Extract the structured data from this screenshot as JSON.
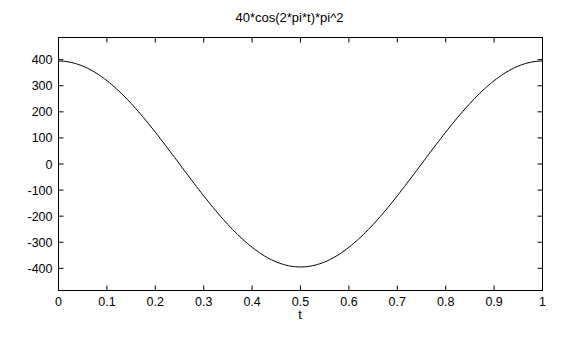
{
  "chart_data": {
    "type": "line",
    "title": "40*cos(2*pi*t)*pi^2",
    "xlabel": "t",
    "ylabel": "",
    "xlim": [
      0,
      1
    ],
    "ylim": [
      -485,
      485
    ],
    "xticks": [
      0,
      0.1,
      0.2,
      0.3,
      0.4,
      0.5,
      0.6,
      0.7,
      0.8,
      0.9,
      1
    ],
    "xtick_labels": [
      "0",
      "0.1",
      "0.2",
      "0.3",
      "0.4",
      "0.5",
      "0.6",
      "0.7",
      "0.8",
      "0.9",
      "1"
    ],
    "yticks": [
      400,
      300,
      200,
      100,
      0,
      -100,
      -200,
      -300,
      -400
    ],
    "ytick_labels": [
      "400",
      "300",
      "200",
      "100",
      "0",
      "-100",
      "-200",
      "-300",
      "-400"
    ],
    "grid": false,
    "legend": null,
    "series": [
      {
        "name": "40*cos(2*pi*t)*pi^2",
        "color": "#000000",
        "x": [
          0,
          0.05,
          0.1,
          0.15,
          0.2,
          0.25,
          0.3,
          0.35,
          0.4,
          0.45,
          0.5,
          0.55,
          0.6,
          0.65,
          0.7,
          0.75,
          0.8,
          0.85,
          0.9,
          0.95,
          1
        ],
        "values": [
          394.8,
          375.5,
          319.4,
          232.1,
          122.0,
          0.0,
          -122.0,
          -232.1,
          -319.4,
          -375.5,
          -394.8,
          -375.5,
          -319.4,
          -232.1,
          -122.0,
          0.0,
          122.0,
          232.1,
          319.4,
          375.5,
          394.8
        ]
      }
    ]
  },
  "figure": {
    "title": "40*cos(2*pi*t)*pi^2",
    "xlabel": "t",
    "background": "#ffffff",
    "line_color": "#000000"
  }
}
